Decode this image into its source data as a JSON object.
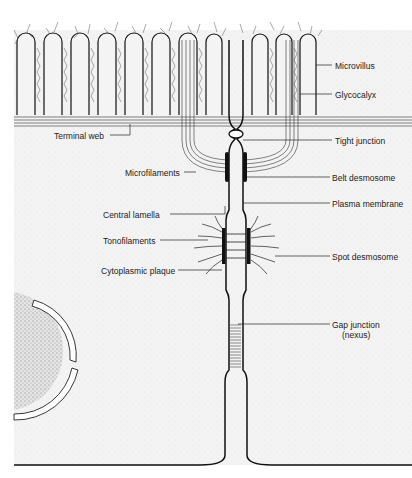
{
  "diagram": {
    "labels_right": [
      {
        "id": "microvillus",
        "text": "Microvillus",
        "x": 335,
        "y": 61
      },
      {
        "id": "glycocalyx",
        "text": "Glycocalyx",
        "x": 335,
        "y": 90
      },
      {
        "id": "tight-junction",
        "text": "Tight junction",
        "x": 335,
        "y": 136
      },
      {
        "id": "belt-desmosome",
        "text": "Belt desmosome",
        "x": 332,
        "y": 173
      },
      {
        "id": "plasma-membrane",
        "text": "Plasma membrane",
        "x": 332,
        "y": 199
      },
      {
        "id": "spot-desmosome",
        "text": "Spot desmosome",
        "x": 332,
        "y": 252
      },
      {
        "id": "gap-junction",
        "text": "Gap junction",
        "x": 332,
        "y": 320
      },
      {
        "id": "gap-junction-sub",
        "text": "(nexus)",
        "x": 342,
        "y": 330
      }
    ],
    "labels_left": [
      {
        "id": "terminal-web",
        "text": "Terminal web",
        "x": 54,
        "y": 131
      },
      {
        "id": "microfilaments",
        "text": "Microfilaments",
        "x": 125,
        "y": 168
      },
      {
        "id": "central-lamella",
        "text": "Central lamella",
        "x": 103,
        "y": 210
      },
      {
        "id": "tonofilaments",
        "text": "Tonofilaments",
        "x": 103,
        "y": 236
      },
      {
        "id": "cytoplasmic-plaque",
        "text": "Cytoplasmic plaque",
        "x": 101,
        "y": 266
      }
    ]
  }
}
